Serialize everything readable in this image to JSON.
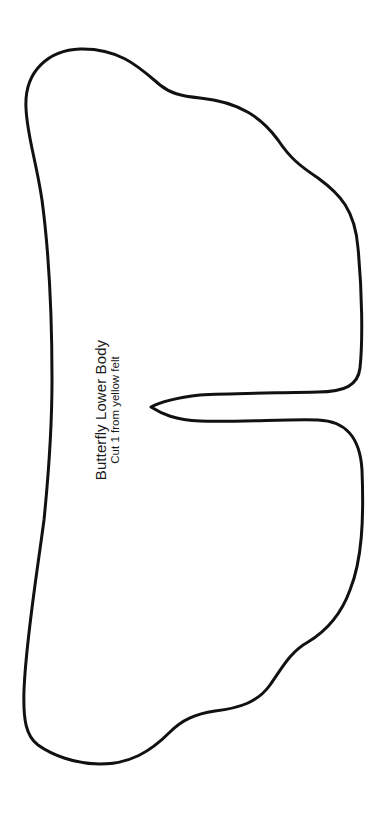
{
  "template": {
    "title": "Butterfly Lower Body",
    "instruction": "Cut 1 from yellow felt",
    "outline": {
      "stroke_color": "#111111",
      "fill_color": "#ffffff",
      "stroke_width": 3
    }
  },
  "page": {
    "background": "#ffffff"
  }
}
